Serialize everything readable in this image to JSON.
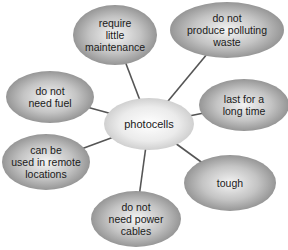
{
  "diagram": {
    "type": "spider-diagram",
    "center": {
      "label": "photocells",
      "cx": 149,
      "cy": 124,
      "rx": 45,
      "ry": 26
    },
    "nodes": [
      {
        "id": "maintenance",
        "lines": [
          "require",
          "little",
          "maintenance"
        ],
        "cx": 115,
        "cy": 35,
        "rx": 42,
        "ry": 30
      },
      {
        "id": "polluting",
        "lines": [
          "do not",
          "produce polluting",
          "waste"
        ],
        "cx": 227,
        "cy": 30,
        "rx": 57,
        "ry": 28
      },
      {
        "id": "fuel",
        "lines": [
          "do not",
          "need fuel"
        ],
        "cx": 50,
        "cy": 97,
        "rx": 44,
        "ry": 26
      },
      {
        "id": "long-time",
        "lines": [
          "last for a",
          "long time"
        ],
        "cx": 244,
        "cy": 105,
        "rx": 45,
        "ry": 26
      },
      {
        "id": "remote",
        "lines": [
          "can be",
          "used in remote",
          "locations"
        ],
        "cx": 46,
        "cy": 162,
        "rx": 44,
        "ry": 28
      },
      {
        "id": "tough",
        "lines": [
          "tough"
        ],
        "cx": 230,
        "cy": 183,
        "rx": 46,
        "ry": 28
      },
      {
        "id": "power-cables",
        "lines": [
          "do not",
          "need power",
          "cables"
        ],
        "cx": 136,
        "cy": 219,
        "rx": 45,
        "ry": 28
      }
    ],
    "colors": {
      "node_light": "#f2f2f2",
      "node_dark": "#8c8c8c",
      "center_light": "#ffffff",
      "center_dark": "#cfcfcf",
      "connector": "#555555",
      "text": "#1a1a1a"
    }
  }
}
